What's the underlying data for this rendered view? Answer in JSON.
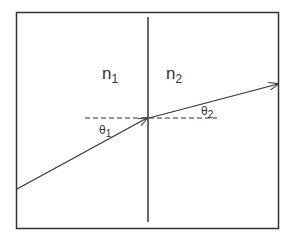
{
  "diagram": {
    "regions": [
      {
        "id": "medium-1",
        "label": "n",
        "subscript": "1"
      },
      {
        "id": "medium-2",
        "label": "n",
        "subscript": "2"
      }
    ],
    "angles": [
      {
        "id": "angle-incidence",
        "label": "θ",
        "subscript": "1"
      },
      {
        "id": "angle-refraction",
        "label": "θ",
        "subscript": "2"
      }
    ],
    "colors": {
      "line": "#333333",
      "background": "#ffffff"
    }
  }
}
